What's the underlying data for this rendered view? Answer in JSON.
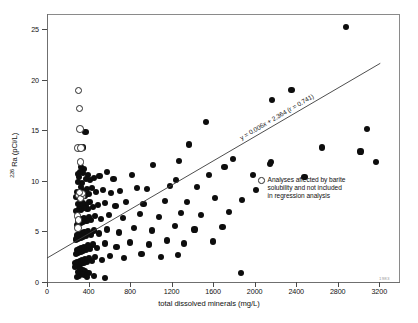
{
  "chart_data": {
    "type": "scatter",
    "title": "",
    "xlabel": "total dissolved minerals (mg/L)",
    "ylabel": "226 Ra (pCi/L)",
    "ylabel_sup": "226",
    "ylabel_rest": " Ra (pCi/L)",
    "xlim": [
      0,
      3400
    ],
    "ylim": [
      0,
      26.5
    ],
    "xticks": [
      0,
      400,
      800,
      1200,
      1600,
      2000,
      2400,
      2800,
      3200
    ],
    "yticks": [
      0,
      5,
      10,
      15,
      20,
      25
    ],
    "grid": false,
    "legend_position": "upper-right",
    "annotations": [
      {
        "name": "regression-equation",
        "text": "y = 0.006x + 2.364 (r = 0.741)",
        "slope": 0.006,
        "intercept": 2.364,
        "r": 0.741
      }
    ],
    "figure_number": "1983",
    "regression_line": {
      "slope": 0.006,
      "intercept": 2.364,
      "x_start": 0,
      "x_end": 3210,
      "y_start": 2.364,
      "y_end": 21.624
    },
    "series": [
      {
        "name": "Analyses included in regression analysis",
        "marker": "filled-circle",
        "color": "#0d0d0d",
        "points": [
          [
            2880,
            25.2
          ],
          [
            2355,
            19.0
          ],
          [
            2165,
            18.0
          ],
          [
            1530,
            15.8
          ],
          [
            3085,
            15.1
          ],
          [
            370,
            14.8
          ],
          [
            2645,
            13.3
          ],
          [
            3020,
            12.9
          ],
          [
            3165,
            11.9
          ],
          [
            2155,
            11.9
          ],
          [
            2150,
            11.7
          ],
          [
            1710,
            11.4
          ],
          [
            1270,
            12.0
          ],
          [
            1020,
            11.6
          ],
          [
            350,
            13.3
          ],
          [
            2480,
            10.4
          ],
          [
            1985,
            10.6
          ],
          [
            1560,
            10.6
          ],
          [
            1245,
            10.1
          ],
          [
            820,
            10.6
          ],
          [
            640,
            10.2
          ],
          [
            575,
            10.9
          ],
          [
            505,
            10.5
          ],
          [
            455,
            10.3
          ],
          [
            415,
            10.1
          ],
          [
            395,
            10.6
          ],
          [
            375,
            10.2
          ],
          [
            360,
            11.2
          ],
          [
            345,
            10.8
          ],
          [
            335,
            9.8
          ],
          [
            330,
            11.4
          ],
          [
            320,
            10.9
          ],
          [
            310,
            10.4
          ],
          [
            300,
            9.9
          ],
          [
            295,
            10.7
          ],
          [
            2015,
            9.1
          ],
          [
            1445,
            9.4
          ],
          [
            1185,
            9.5
          ],
          [
            960,
            9.2
          ],
          [
            870,
            9.3
          ],
          [
            700,
            9.0
          ],
          [
            620,
            8.8
          ],
          [
            540,
            9.1
          ],
          [
            470,
            8.9
          ],
          [
            430,
            9.3
          ],
          [
            400,
            8.7
          ],
          [
            385,
            9.2
          ],
          [
            365,
            8.5
          ],
          [
            350,
            9.0
          ],
          [
            340,
            8.6
          ],
          [
            325,
            9.4
          ],
          [
            315,
            8.8
          ],
          [
            305,
            8.3
          ],
          [
            290,
            8.9
          ],
          [
            280,
            8.4
          ],
          [
            1880,
            8.1
          ],
          [
            1620,
            8.3
          ],
          [
            1350,
            7.9
          ],
          [
            1140,
            8.0
          ],
          [
            930,
            7.7
          ],
          [
            760,
            7.9
          ],
          [
            660,
            7.5
          ],
          [
            560,
            7.8
          ],
          [
            490,
            7.6
          ],
          [
            440,
            7.4
          ],
          [
            410,
            7.9
          ],
          [
            390,
            7.2
          ],
          [
            370,
            7.6
          ],
          [
            355,
            7.3
          ],
          [
            345,
            7.8
          ],
          [
            330,
            7.1
          ],
          [
            320,
            7.5
          ],
          [
            310,
            7.2
          ],
          [
            300,
            7.7
          ],
          [
            285,
            7.0
          ],
          [
            1755,
            6.9
          ],
          [
            1480,
            6.6
          ],
          [
            1290,
            6.8
          ],
          [
            1075,
            6.4
          ],
          [
            895,
            6.7
          ],
          [
            730,
            6.3
          ],
          [
            600,
            6.6
          ],
          [
            520,
            6.2
          ],
          [
            460,
            6.5
          ],
          [
            425,
            6.1
          ],
          [
            405,
            6.4
          ],
          [
            380,
            6.0
          ],
          [
            360,
            6.3
          ],
          [
            350,
            5.9
          ],
          [
            340,
            6.2
          ],
          [
            328,
            5.8
          ],
          [
            318,
            6.1
          ],
          [
            306,
            5.7
          ],
          [
            296,
            6.0
          ],
          [
            286,
            5.6
          ],
          [
            1690,
            5.4
          ],
          [
            1420,
            5.2
          ],
          [
            1230,
            5.5
          ],
          [
            1010,
            5.1
          ],
          [
            840,
            5.3
          ],
          [
            690,
            4.9
          ],
          [
            580,
            5.2
          ],
          [
            500,
            4.8
          ],
          [
            450,
            5.1
          ],
          [
            420,
            4.7
          ],
          [
            398,
            5.0
          ],
          [
            378,
            4.6
          ],
          [
            362,
            4.9
          ],
          [
            348,
            4.5
          ],
          [
            336,
            4.8
          ],
          [
            324,
            4.4
          ],
          [
            312,
            4.7
          ],
          [
            302,
            4.3
          ],
          [
            292,
            4.6
          ],
          [
            282,
            4.2
          ],
          [
            1595,
            4.0
          ],
          [
            1320,
            3.8
          ],
          [
            1155,
            4.1
          ],
          [
            980,
            3.7
          ],
          [
            800,
            3.9
          ],
          [
            670,
            3.5
          ],
          [
            555,
            3.8
          ],
          [
            480,
            3.4
          ],
          [
            445,
            3.7
          ],
          [
            415,
            3.3
          ],
          [
            392,
            3.6
          ],
          [
            372,
            3.2
          ],
          [
            358,
            3.5
          ],
          [
            344,
            3.1
          ],
          [
            332,
            3.4
          ],
          [
            322,
            3.0
          ],
          [
            308,
            3.3
          ],
          [
            298,
            2.9
          ],
          [
            288,
            3.2
          ],
          [
            278,
            2.8
          ],
          [
            1265,
            2.7
          ],
          [
            1100,
            2.5
          ],
          [
            910,
            2.8
          ],
          [
            745,
            2.4
          ],
          [
            610,
            2.6
          ],
          [
            530,
            2.2
          ],
          [
            465,
            2.5
          ],
          [
            435,
            2.1
          ],
          [
            408,
            2.4
          ],
          [
            388,
            2.0
          ],
          [
            368,
            2.3
          ],
          [
            352,
            1.9
          ],
          [
            338,
            2.2
          ],
          [
            326,
            1.8
          ],
          [
            314,
            2.1
          ],
          [
            304,
            1.7
          ],
          [
            294,
            2.0
          ],
          [
            284,
            1.6
          ],
          [
            274,
            1.9
          ],
          [
            268,
            1.5
          ],
          [
            560,
            0.4
          ],
          [
            455,
            0.6
          ],
          [
            400,
            0.9
          ],
          [
            382,
            0.5
          ],
          [
            366,
            1.1
          ],
          [
            354,
            0.7
          ],
          [
            342,
            1.2
          ],
          [
            334,
            0.8
          ],
          [
            320,
            1.3
          ],
          [
            310,
            0.6
          ],
          [
            300,
            1.0
          ],
          [
            290,
            0.5
          ],
          [
            1870,
            0.9
          ],
          [
            1370,
            13.6
          ],
          [
            1795,
            12.2
          ]
        ]
      },
      {
        "name": "Analyses affected by barite solubility and not included in regression analysis",
        "marker": "open-circle",
        "color": "#ffffff",
        "points": [
          [
            300,
            19.0
          ],
          [
            310,
            17.2
          ],
          [
            312,
            15.2
          ],
          [
            295,
            13.3
          ],
          [
            322,
            13.3
          ],
          [
            318,
            11.9
          ],
          [
            300,
            8.6
          ],
          [
            330,
            8.5
          ],
          [
            318,
            8.3
          ],
          [
            288,
            6.6
          ],
          [
            300,
            6.2
          ],
          [
            292,
            5.4
          ],
          [
            336,
            8.8
          ],
          [
            310,
            8.9
          ]
        ]
      }
    ]
  },
  "legend": {
    "marker": "open-circle",
    "lines": [
      "Analyses affected by barite",
      "solubility and not included",
      "in regression analysis"
    ],
    "full_text": "Analyses affected by barite solubility and not included in regression analysis"
  },
  "colors": {
    "filled_marker": "#0d0d0d",
    "open_marker_edge": "#2a2a2a",
    "axis": "#6f6f6f",
    "frame": "#8a8a8a",
    "text": "#111111",
    "background": "#ffffff"
  }
}
